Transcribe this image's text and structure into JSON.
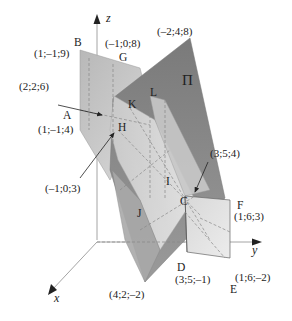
{
  "figure": {
    "axes": {
      "x": "x",
      "y": "y",
      "z": "z"
    },
    "plane_label": "Π",
    "points": [
      {
        "name": "B",
        "coords": "(1;–1;9)"
      },
      {
        "name": "G",
        "coords": "(–1;0;8)"
      },
      {
        "name": "apex",
        "coords": "(–2;4;8)"
      },
      {
        "name": "K",
        "coords": "(2;2;6)"
      },
      {
        "name": "L",
        "coords": ""
      },
      {
        "name": "A",
        "coords": "(1;–1;4)"
      },
      {
        "name": "H",
        "coords": "(–1;0;3)"
      },
      {
        "name": "I",
        "coords": ""
      },
      {
        "name": "J",
        "coords": ""
      },
      {
        "name": "C",
        "coords": "(3;5;4)"
      },
      {
        "name": "F",
        "coords": "(1;6;3)"
      },
      {
        "name": "D",
        "coords": "(3;5;–1)"
      },
      {
        "name": "E",
        "coords": "(1;6;–2)"
      },
      {
        "name": "bottom",
        "coords": "(4;2;–2)"
      }
    ],
    "labels": {
      "z": "z",
      "y": "y",
      "x": "x",
      "Pi": "Π",
      "B": "B",
      "B_coords": "(1;–1;9)",
      "G": "G",
      "G_coords": "(–1;0;8)",
      "apex_coords": "(–2;4;8)",
      "K_arrow_coords": "(2;2;6)",
      "K": "K",
      "L": "L",
      "A": "A",
      "A_coords": "(1;–1;4)",
      "H": "H",
      "H_arrow_coords": "(–1;0;3)",
      "I": "I",
      "J": "J",
      "C": "C",
      "C_arrow_coords": "(3;5;4)",
      "F": "F",
      "F_coords": "(1;6;3)",
      "D": "D",
      "D_coords": "(3;5;–1)",
      "E": "E",
      "E_coords": "(1;6;–2)",
      "bottom_coords": "(4;2;–2)"
    }
  }
}
